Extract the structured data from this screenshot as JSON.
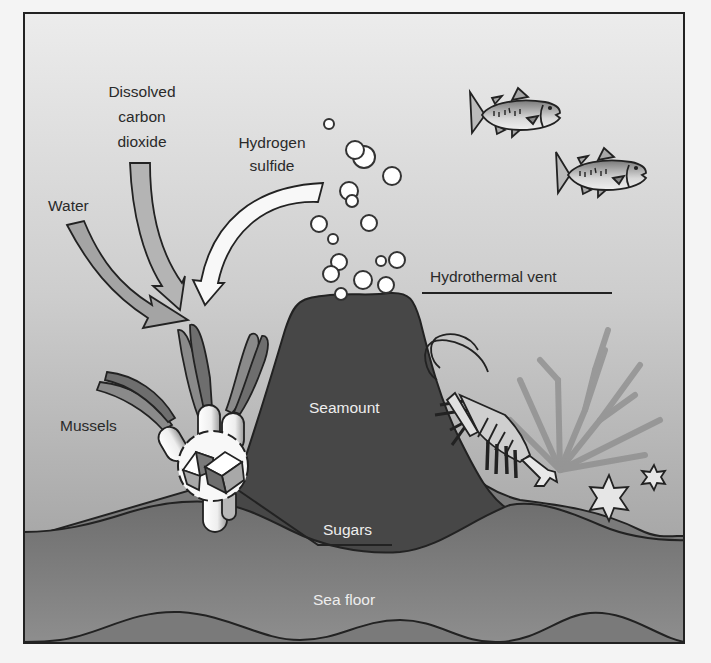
{
  "diagram": {
    "type": "illustration",
    "colors": {
      "water_top": "#e6e6e6",
      "water_bottom": "#9a9a9a",
      "seamount": "#4a4a4a",
      "sea_floor": "#7e7e7e",
      "outline": "#222222"
    }
  },
  "labels": {
    "dissolved_co2_line1": "Dissolved",
    "dissolved_co2_line2": "carbon",
    "dissolved_co2_line3": "dioxide",
    "hydrogen_sulfide_line1": "Hydrogen",
    "hydrogen_sulfide_line2": "sulfide",
    "water": "Water",
    "hydrothermal_vent": "Hydrothermal vent",
    "mussels": "Mussels",
    "seamount": "Seamount",
    "sugars": "Sugars",
    "sea_floor": "Sea floor"
  },
  "elements": {
    "arrows": [
      "water-arrow",
      "dissolved-co2-arrow",
      "hydrogen-sulfide-arrow"
    ],
    "organisms": [
      "fish",
      "fish",
      "mussels",
      "shrimp",
      "coral",
      "starfish",
      "starfish"
    ],
    "bubbles_count": 17
  }
}
